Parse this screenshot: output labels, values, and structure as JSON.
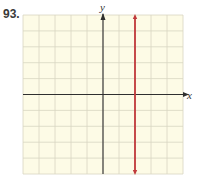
{
  "problem": {
    "number": "93."
  },
  "axes": {
    "x_label": "x",
    "y_label": "y"
  },
  "colors": {
    "grid_bg": "#fdfbe6",
    "grid_line": "#d8d6c2",
    "axis": "#2f2f2f",
    "graph_line": "#c0393b"
  },
  "chart_data": {
    "type": "line",
    "title": "",
    "xlabel": "x",
    "ylabel": "y",
    "xlim": [
      -5,
      5
    ],
    "ylim": [
      -5,
      5
    ],
    "grid": true,
    "tick_labels": false,
    "series": [
      {
        "name": "x = 2",
        "kind": "vertical_line",
        "x": 2,
        "points": [
          [
            2,
            -5
          ],
          [
            2,
            5
          ]
        ],
        "arrows": "both",
        "color": "#c0393b"
      }
    ],
    "legend": null
  }
}
